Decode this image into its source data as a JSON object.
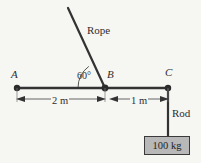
{
  "figure": {
    "type": "physics-free-body-diagram",
    "background_color": "#f6f6f3",
    "stroke_color": "#333333",
    "mass_box_fill": "#b8b8b8"
  },
  "points": {
    "a_label": "A",
    "b_label": "B",
    "c_label": "C"
  },
  "annotations": {
    "rope_label": "Rope",
    "rod_label": "Rod",
    "angle_label": "60°"
  },
  "dimensions": [
    {
      "label": "2 m",
      "from": "A",
      "to": "B"
    },
    {
      "label": "1 m",
      "from": "B",
      "to": "C"
    }
  ],
  "load": {
    "mass_label": "100 kg"
  }
}
